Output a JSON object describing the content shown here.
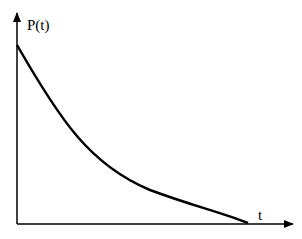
{
  "diagram": {
    "y_axis_label": "P(t)",
    "x_axis_label": "t",
    "curve": "decreasing convex decay curve from y-axis down to x-axis",
    "colors": {
      "stroke": "#000000",
      "background": "#ffffff"
    }
  }
}
